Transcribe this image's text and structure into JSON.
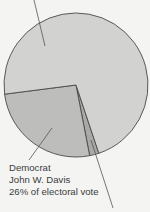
{
  "chart_data": {
    "type": "pie",
    "title": "",
    "center": [
      76,
      85
    ],
    "radius": 72,
    "slices": [
      {
        "name": "Republican",
        "candidate": "",
        "value": 71.9,
        "color": "#d2d2d1",
        "label_visible": false
      },
      {
        "name": "Democrat",
        "candidate": "John W. Davis",
        "value": 26,
        "color": "#bdbdbc",
        "label_visible": true
      },
      {
        "name": "Progressive",
        "candidate": "",
        "value": 2.1,
        "color": "#a9a9a8",
        "label_visible": false
      }
    ],
    "annotations": [
      {
        "slice": "Democrat",
        "lines": [
          "Democrat",
          "John W. Davis",
          "26% of electoral vote"
        ]
      }
    ],
    "leader_lines": [
      {
        "from": [
          34,
          0
        ],
        "to": [
          45,
          46
        ]
      },
      {
        "from": [
          29,
          160
        ],
        "to": [
          52,
          128
        ]
      },
      {
        "from": [
          91,
          140
        ],
        "to": [
          113,
          208
        ]
      }
    ],
    "stroke_color": "#4a4a4a"
  },
  "legend": {
    "line1": "Democrat",
    "line2": "John W. Davis",
    "line3": "26% of electoral vote"
  }
}
